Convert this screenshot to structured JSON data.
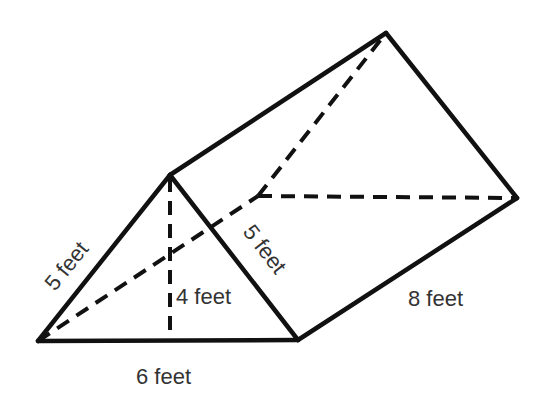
{
  "figure": {
    "type": "triangular-prism",
    "vertices": {
      "front_left": [
        38,
        341
      ],
      "front_right": [
        298,
        340
      ],
      "front_apex": [
        170,
        175
      ],
      "back_left": [
        258,
        196
      ],
      "back_right": [
        517,
        198
      ],
      "back_apex": [
        386,
        33
      ],
      "height_foot": [
        170,
        340
      ]
    },
    "colors": {
      "line": "#111111",
      "text": "#333333",
      "background": "#ffffff"
    }
  },
  "labels": {
    "left_side": "5 feet",
    "right_side": "5 feet",
    "height": "4 feet",
    "base": "6 feet",
    "length": "8 feet"
  }
}
